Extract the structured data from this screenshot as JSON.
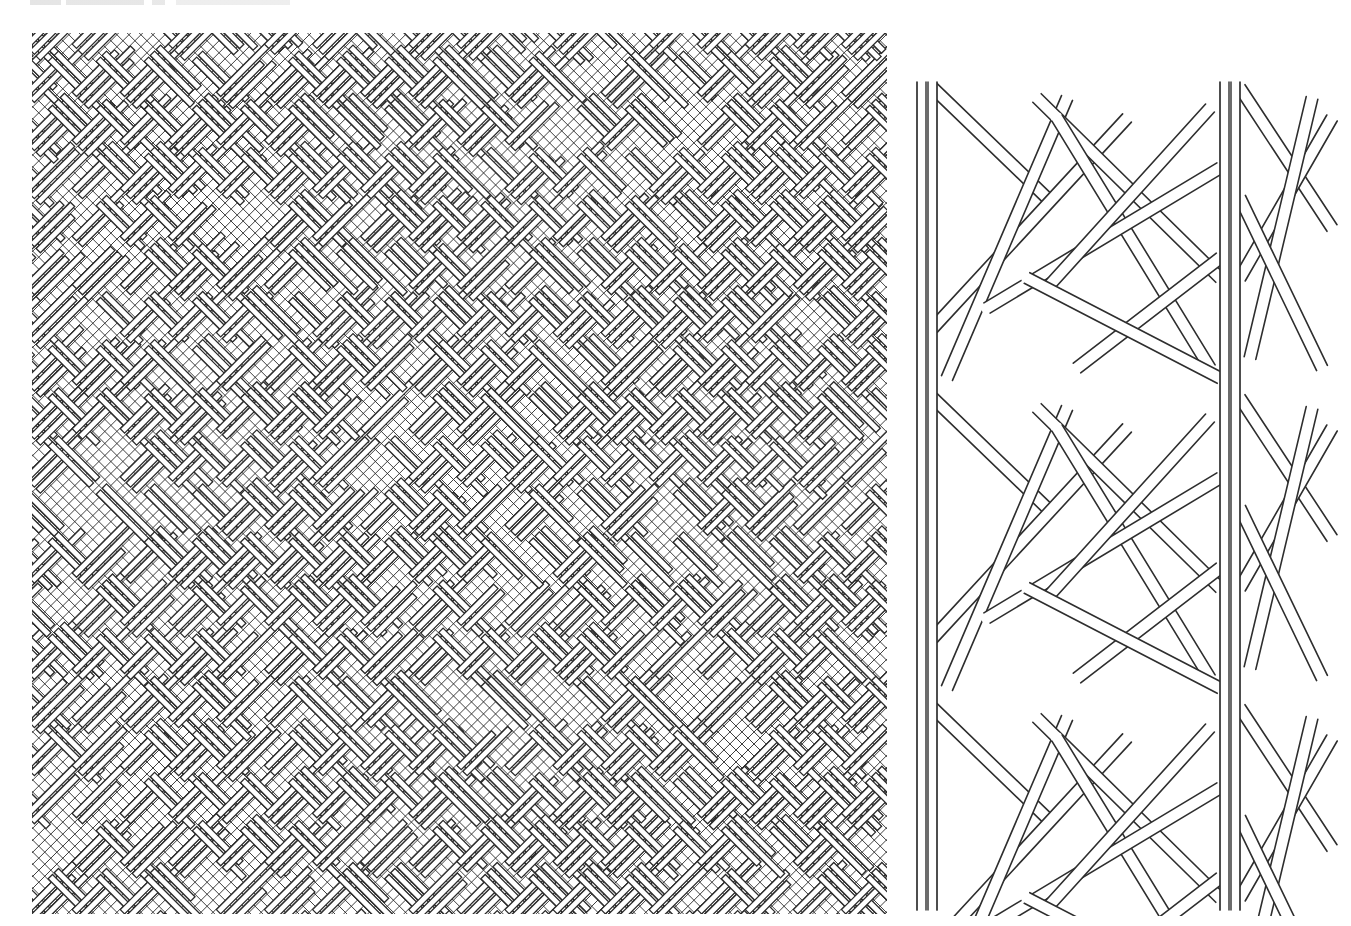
{
  "figure": {
    "caption_visible": false,
    "caption_note": "",
    "panels": [
      {
        "id": "weave",
        "kind": "diagonal-twill-weave",
        "grid_pitch_px": 8.5,
        "angle_deg": 45,
        "stroke": "#2a2a2a",
        "background": "#ffffff"
      },
      {
        "id": "braid",
        "kind": "tubular-braid-double-strand",
        "strand_width_px": 12,
        "stroke": "#2e2e2e",
        "background": "#ffffff",
        "columns_x": [
          927,
          1230
        ]
      }
    ]
  }
}
